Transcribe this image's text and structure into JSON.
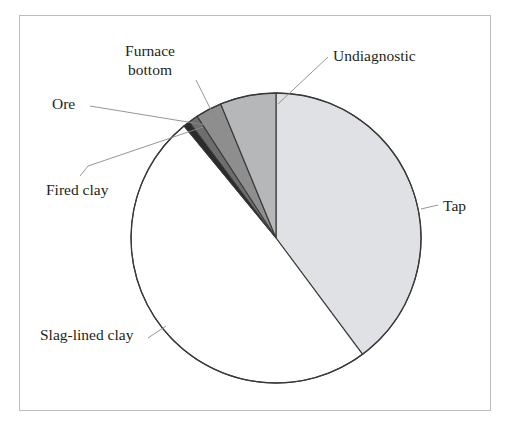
{
  "figure": {
    "background_color": "#ffffff",
    "frame_color": "#b9bcc0",
    "outline_color": "#3a3a3a"
  },
  "chart_data": {
    "type": "pie",
    "title": "",
    "subtitle": "",
    "xlabel": "",
    "ylabel": "",
    "legend_position": "none",
    "grid": false,
    "labels_placement": "outside-with-leader-lines",
    "start_angle_deg": 0,
    "direction": "clockwise",
    "categories": [
      "Tap",
      "Slag-lined clay",
      "Fired clay",
      "Ore",
      "Furnace bottom",
      "Undiagnostic"
    ],
    "values": [
      42.2,
      52.2,
      0.8,
      1.1,
      3.1,
      6.6
    ],
    "units": "percent",
    "slices": [
      {
        "label": "Tap",
        "value": 42.2,
        "start_angle_deg": 0,
        "end_angle_deg": 152,
        "color": "#dfe1e4",
        "edge_color": "#3a3a3a"
      },
      {
        "label": "Slag-lined clay",
        "value": 52.2,
        "start_angle_deg": 152,
        "end_angle_deg": 340,
        "color": "#ffffff",
        "edge_color": "#3a3a3a"
      },
      {
        "label": "Fired clay",
        "value": 0.8,
        "start_angle_deg": 340,
        "end_angle_deg": 343,
        "color": "#2b2b2b",
        "edge_color": "#3a3a3a"
      },
      {
        "label": "Ore",
        "value": 1.1,
        "start_angle_deg": 343,
        "end_angle_deg": 347,
        "color": "#6e6e6e",
        "edge_color": "#3a3a3a"
      },
      {
        "label": "Furnace bottom",
        "value": 3.1,
        "start_angle_deg": 347,
        "end_angle_deg": 358,
        "color": "#8e8e8e",
        "edge_color": "#3a3a3a"
      },
      {
        "label": "Undiagnostic",
        "value": 6.6,
        "start_angle_deg": 358,
        "end_angle_deg": 384,
        "color": "#b5b7b9",
        "edge_color": "#3a3a3a"
      }
    ]
  },
  "labels": {
    "furnace_bottom": "Furnace bottom",
    "undiagnostic": "Undiagnostic",
    "ore": "Ore",
    "fired_clay": "Fired clay",
    "slag_lined_clay": "Slag-lined clay",
    "tap": "Tap"
  }
}
